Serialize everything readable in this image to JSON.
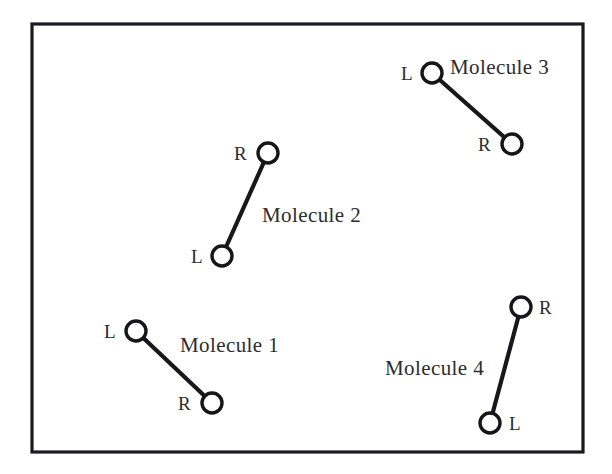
{
  "figure": {
    "background_color": "#ffffff",
    "stroke_color": "#18181c",
    "frame": {
      "x": 32,
      "y": 24,
      "width": 551,
      "height": 428
    }
  },
  "atom_labels": {
    "left": "L",
    "right": "R"
  },
  "molecules": [
    {
      "name": "molecule-1",
      "label": "Molecule 1",
      "label_x": 180,
      "label_y": 352,
      "atoms": [
        {
          "role": "L",
          "letter": "L",
          "cx": 136,
          "cy": 331,
          "r": 10,
          "letter_x": 104,
          "letter_y": 338
        },
        {
          "role": "R",
          "letter": "R",
          "cx": 212,
          "cy": 403,
          "r": 10,
          "letter_x": 178,
          "letter_y": 410
        }
      ]
    },
    {
      "name": "molecule-2",
      "label": "Molecule 2",
      "label_x": 262,
      "label_y": 222,
      "atoms": [
        {
          "role": "R",
          "letter": "R",
          "cx": 268,
          "cy": 153,
          "r": 10,
          "letter_x": 234,
          "letter_y": 160
        },
        {
          "role": "L",
          "letter": "L",
          "cx": 222,
          "cy": 256,
          "r": 10,
          "letter_x": 191,
          "letter_y": 263
        }
      ]
    },
    {
      "name": "molecule-3",
      "label": "Molecule  3",
      "label_x": 450,
      "label_y": 74,
      "atoms": [
        {
          "role": "L",
          "letter": "L",
          "cx": 432,
          "cy": 73,
          "r": 10,
          "letter_x": 401,
          "letter_y": 80
        },
        {
          "role": "R",
          "letter": "R",
          "cx": 512,
          "cy": 144,
          "r": 10,
          "letter_x": 478,
          "letter_y": 151
        }
      ]
    },
    {
      "name": "molecule-4",
      "label": "Molecule 4",
      "label_x": 385,
      "label_y": 375,
      "atoms": [
        {
          "role": "R",
          "letter": "R",
          "cx": 521,
          "cy": 307,
          "r": 10,
          "letter_x": 539,
          "letter_y": 314
        },
        {
          "role": "L",
          "letter": "L",
          "cx": 490,
          "cy": 423,
          "r": 10,
          "letter_x": 509,
          "letter_y": 430
        }
      ]
    }
  ]
}
